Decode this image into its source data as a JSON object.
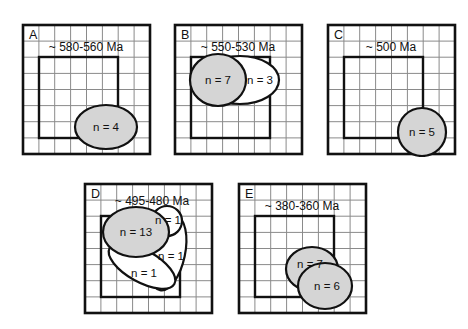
{
  "figure": {
    "type": "scientific-diagram",
    "colors": {
      "background": "#ffffff",
      "grid_line": "#8a8a8a",
      "outer_frame": "#111111",
      "inner_square": "#111111",
      "shape_outline": "#111111",
      "shape_fill_gray": "#d5d5d5",
      "shape_fill_white": "#ffffff",
      "text": "#111111"
    },
    "panels": [
      {
        "id": "A",
        "label": "A",
        "age": "~ 580-560 Ma",
        "grid_columns": 8,
        "grid_rows": 8,
        "shapes": [
          {
            "label": "n = 4",
            "value": 4,
            "fill": "gray",
            "kind": "ellipse"
          }
        ]
      },
      {
        "id": "B",
        "label": "B",
        "age": "~ 550-530 Ma",
        "grid_columns": 8,
        "grid_rows": 8,
        "shapes": [
          {
            "label": "n = 3",
            "value": 3,
            "fill": "white",
            "kind": "ellipse"
          },
          {
            "label": "n = 7",
            "value": 7,
            "fill": "gray",
            "kind": "ellipse"
          }
        ]
      },
      {
        "id": "C",
        "label": "C",
        "age": "~ 500 Ma",
        "grid_columns": 8,
        "grid_rows": 8,
        "shapes": [
          {
            "label": "n = 5",
            "value": 5,
            "fill": "gray",
            "kind": "circle"
          }
        ]
      },
      {
        "id": "D",
        "label": "D",
        "age": "~ 495-480 Ma",
        "grid_columns": 8,
        "grid_rows": 8,
        "shapes": [
          {
            "label": "n = 1",
            "value": 1,
            "fill": "white",
            "kind": "ellipse"
          },
          {
            "label": "n = 1",
            "value": 1,
            "fill": "white",
            "kind": "ellipse"
          },
          {
            "label": "n = 1",
            "value": 1,
            "fill": "white",
            "kind": "ellipse"
          },
          {
            "label": "n = 13",
            "value": 13,
            "fill": "gray",
            "kind": "ellipse"
          }
        ]
      },
      {
        "id": "E",
        "label": "E",
        "age": "~ 380-360 Ma",
        "grid_columns": 8,
        "grid_rows": 8,
        "shapes": [
          {
            "label": "n = 7",
            "value": 7,
            "fill": "gray",
            "kind": "ellipse"
          },
          {
            "label": "n = 6",
            "value": 6,
            "fill": "gray",
            "kind": "ellipse"
          }
        ]
      }
    ]
  }
}
